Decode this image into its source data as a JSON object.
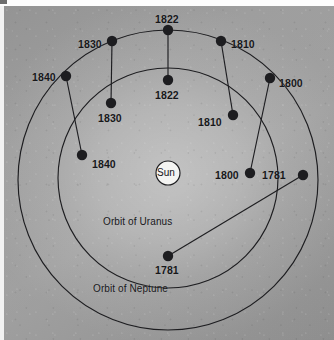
{
  "figure": {
    "background_color": "#a4a4a4",
    "ink_color": "#1d1d20",
    "sun": {
      "label": "Sun",
      "cx": 168,
      "cy": 173,
      "r": 12,
      "fill": "#f4f4f2",
      "stroke": "#1d1d20"
    },
    "orbits": [
      {
        "name": "uranus",
        "caption": "Orbit of Uranus",
        "cx": 168,
        "cy": 178,
        "r": 110,
        "caption_x": 103,
        "caption_y": 216
      },
      {
        "name": "neptune",
        "caption": "Orbit of Neptune",
        "cx": 168,
        "cy": 180,
        "r": 150,
        "caption_x": 93,
        "caption_y": 283
      }
    ],
    "marker_radius": 5.2,
    "markers": [
      {
        "year": "1781",
        "orbit": "neptune",
        "cx": 303,
        "cy": 175,
        "label_x": 262,
        "label_y": 169
      },
      {
        "year": "1800",
        "orbit": "neptune",
        "cx": 270,
        "cy": 78,
        "label_x": 279,
        "label_y": 77
      },
      {
        "year": "1810",
        "orbit": "neptune",
        "cx": 221,
        "cy": 41,
        "label_x": 231,
        "label_y": 38
      },
      {
        "year": "1822",
        "orbit": "neptune",
        "cx": 168,
        "cy": 30,
        "label_x": 155,
        "label_y": 13
      },
      {
        "year": "1830",
        "orbit": "neptune",
        "cx": 112,
        "cy": 41,
        "label_x": 78,
        "label_y": 38
      },
      {
        "year": "1840",
        "orbit": "neptune",
        "cx": 66,
        "cy": 76,
        "label_x": 32,
        "label_y": 71
      },
      {
        "year": "1781",
        "orbit": "uranus",
        "cx": 168,
        "cy": 256,
        "label_x": 155,
        "label_y": 264
      },
      {
        "year": "1800",
        "orbit": "uranus",
        "cx": 250,
        "cy": 173,
        "label_x": 215,
        "label_y": 169
      },
      {
        "year": "1810",
        "orbit": "uranus",
        "cx": 233,
        "cy": 115,
        "label_x": 198,
        "label_y": 116
      },
      {
        "year": "1822",
        "orbit": "uranus",
        "cx": 168,
        "cy": 80,
        "label_x": 155,
        "label_y": 89
      },
      {
        "year": "1830",
        "orbit": "uranus",
        "cx": 111,
        "cy": 103,
        "label_x": 98,
        "label_y": 112
      },
      {
        "year": "1840",
        "orbit": "uranus",
        "cx": 82,
        "cy": 155,
        "label_x": 92,
        "label_y": 158
      }
    ],
    "connectors": [
      {
        "year": "1822",
        "x1": 168,
        "y1": 30,
        "x2": 168,
        "y2": 80
      },
      {
        "year": "1830",
        "x1": 112,
        "y1": 41,
        "x2": 111,
        "y2": 103
      },
      {
        "year": "1840",
        "x1": 66,
        "y1": 76,
        "x2": 82,
        "y2": 155
      },
      {
        "year": "1810",
        "x1": 221,
        "y1": 41,
        "x2": 233,
        "y2": 115
      },
      {
        "year": "1800",
        "x1": 270,
        "y1": 78,
        "x2": 250,
        "y2": 173
      },
      {
        "year": "1781",
        "x1": 303,
        "y1": 175,
        "x2": 168,
        "y2": 256
      }
    ]
  },
  "chart_data": {
    "type": "scatter",
    "subtitle": "",
    "xlabel": "",
    "ylabel": "",
    "grid": false,
    "legend_position": "none",
    "annotations": [
      "Sun",
      "Orbit of Uranus",
      "Orbit of Neptune"
    ],
    "series": [
      {
        "name": "Orbit of Neptune",
        "orbit_radius_px": 150,
        "years": [
          "1781",
          "1800",
          "1810",
          "1822",
          "1830",
          "1840"
        ],
        "points": [
          [
            303,
            175
          ],
          [
            270,
            78
          ],
          [
            221,
            41
          ],
          [
            168,
            30
          ],
          [
            112,
            41
          ],
          [
            66,
            76
          ]
        ]
      },
      {
        "name": "Orbit of Uranus",
        "orbit_radius_px": 110,
        "years": [
          "1781",
          "1800",
          "1810",
          "1822",
          "1830",
          "1840"
        ],
        "points": [
          [
            168,
            256
          ],
          [
            250,
            173
          ],
          [
            233,
            115
          ],
          [
            168,
            80
          ],
          [
            111,
            103
          ],
          [
            82,
            155
          ]
        ]
      }
    ],
    "pairs": [
      "1781",
      "1800",
      "1810",
      "1822",
      "1830",
      "1840"
    ]
  }
}
